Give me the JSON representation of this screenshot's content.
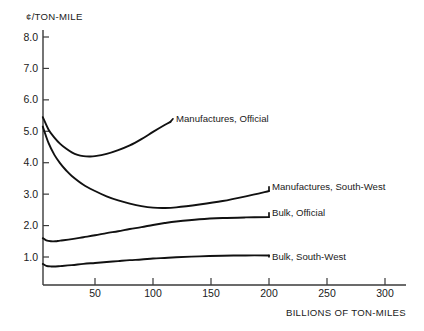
{
  "chart_data": {
    "type": "line",
    "title": "",
    "xlabel": "BILLIONS OF TON-MILES",
    "ylabel": "¢/TON-MILE",
    "xlim": [
      0,
      320
    ],
    "ylim": [
      0.3,
      8.6
    ],
    "grid": false,
    "legend_position": "inline-right-of-curve",
    "xticks": [
      50,
      100,
      150,
      200,
      250,
      300
    ],
    "xtick_labels": [
      "50",
      "100",
      "150",
      "200",
      "250",
      "300"
    ],
    "yticks": [
      1.0,
      2.0,
      3.0,
      4.0,
      5.0,
      6.0,
      7.0,
      8.0
    ],
    "ytick_labels": [
      "1.0",
      "2.0",
      "3.0",
      "4.0",
      "5.0",
      "6.0",
      "7.0",
      "8.0"
    ],
    "series": [
      {
        "name": "Manufactures, Official",
        "label": "Manufactures, Official",
        "x": [
          5,
          10,
          15,
          20,
          25,
          30,
          35,
          40,
          45,
          50,
          60,
          70,
          80,
          90,
          100,
          110,
          115
        ],
        "values": [
          5.45,
          5.05,
          4.8,
          4.6,
          4.45,
          4.33,
          4.25,
          4.21,
          4.2,
          4.21,
          4.28,
          4.4,
          4.55,
          4.75,
          4.98,
          5.2,
          5.3
        ]
      },
      {
        "name": "Manufactures, South-West",
        "label": "Manufactures, South-West",
        "x": [
          5,
          10,
          15,
          20,
          25,
          30,
          40,
          50,
          60,
          70,
          80,
          90,
          100,
          110,
          120,
          140,
          160,
          180,
          200
        ],
        "values": [
          5.15,
          4.62,
          4.25,
          3.98,
          3.76,
          3.58,
          3.3,
          3.1,
          2.93,
          2.8,
          2.7,
          2.62,
          2.57,
          2.56,
          2.58,
          2.67,
          2.78,
          2.93,
          3.1
        ]
      },
      {
        "name": "Bulk, Official",
        "label": "Bulk, Official",
        "x": [
          5,
          8,
          12,
          16,
          20,
          30,
          40,
          50,
          60,
          70,
          80,
          90,
          100,
          110,
          120,
          140,
          160,
          180,
          200
        ],
        "values": [
          1.6,
          1.53,
          1.5,
          1.5,
          1.52,
          1.57,
          1.63,
          1.69,
          1.76,
          1.82,
          1.89,
          1.95,
          2.02,
          2.08,
          2.13,
          2.2,
          2.24,
          2.26,
          2.27
        ]
      },
      {
        "name": "Bulk, South-West",
        "label": "Bulk, South-West",
        "x": [
          5,
          8,
          12,
          16,
          20,
          30,
          40,
          50,
          60,
          70,
          80,
          90,
          100,
          110,
          120,
          140,
          160,
          180,
          200
        ],
        "values": [
          0.78,
          0.72,
          0.7,
          0.7,
          0.71,
          0.74,
          0.78,
          0.81,
          0.84,
          0.87,
          0.9,
          0.92,
          0.95,
          0.97,
          0.99,
          1.02,
          1.04,
          1.05,
          1.05
        ]
      }
    ],
    "colors": {
      "curve": "#111111",
      "axis": "#3a3a3a",
      "background": "#ffffff"
    }
  }
}
